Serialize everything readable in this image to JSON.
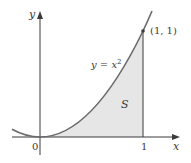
{
  "figure": {
    "axes": {
      "x_label": "x",
      "y_label": "y",
      "origin_label": "0",
      "x_tick_label": "1"
    },
    "curve": {
      "equation_lhs": "y = x",
      "equation_exp": "2",
      "color": "#6b6b6b"
    },
    "point": {
      "label": "(1, 1)"
    },
    "region": {
      "label": "S",
      "fill": "#e6e6e6"
    },
    "colors": {
      "axis": "#3a3a3a",
      "curve": "#6b6b6b",
      "shade": "#e6e6e6",
      "text": "#3a3a3a"
    }
  }
}
